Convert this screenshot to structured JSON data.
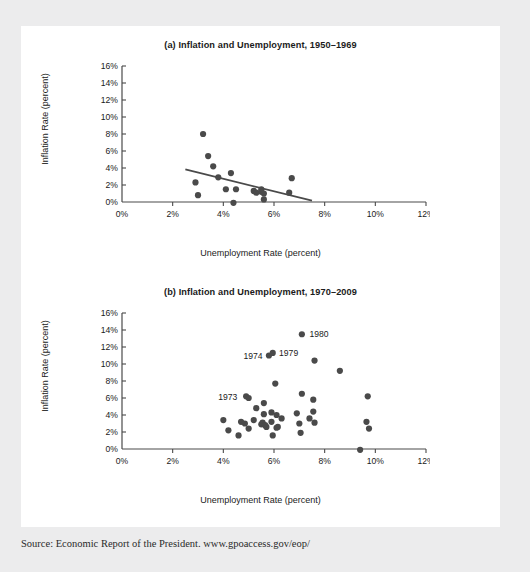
{
  "source_note": "Source: Economic Report of the President. www.gpoaccess.gov/eop/",
  "panel_a": {
    "title": "(a) Inflation and Unemployment, 1950–1969",
    "xlabel": "Unemployment Rate (percent)",
    "ylabel": "Inflation Rate (percent)"
  },
  "panel_b": {
    "title": "(b) Inflation and Unemployment, 1970–2009",
    "xlabel": "Unemployment Rate (percent)",
    "ylabel": "Inflation Rate (percent)"
  },
  "colors": {
    "page_background": "#ececed",
    "card_background": "#ffffff",
    "marker": "#4a4a4a",
    "axis": "#4a4a4a",
    "text": "#1b1b1b",
    "trendline": "#4a4a4a"
  },
  "chart_data": [
    {
      "type": "scatter",
      "id": "panel-a",
      "title": "(a) Inflation and Unemployment, 1950–1969",
      "xlabel": "Unemployment Rate (percent)",
      "ylabel": "Inflation Rate (percent)",
      "xlim": [
        0,
        12
      ],
      "ylim": [
        0,
        16
      ],
      "xticks": [
        0,
        2,
        4,
        6,
        8,
        10,
        12
      ],
      "xticklabels": [
        "0%",
        "2%",
        "4%",
        "6%",
        "8%",
        "10%",
        "12%"
      ],
      "yticks": [
        0,
        2,
        4,
        6,
        8,
        10,
        12,
        14,
        16
      ],
      "yticklabels": [
        "0%",
        "2%",
        "4%",
        "6%",
        "8%",
        "10%",
        "12%",
        "14%",
        "16%"
      ],
      "grid": false,
      "legend": "none",
      "points": [
        {
          "x": 2.9,
          "y": 2.3
        },
        {
          "x": 3.0,
          "y": 0.8
        },
        {
          "x": 3.2,
          "y": 8.0
        },
        {
          "x": 3.4,
          "y": 5.4
        },
        {
          "x": 3.6,
          "y": 4.2
        },
        {
          "x": 3.8,
          "y": 2.9
        },
        {
          "x": 4.1,
          "y": 1.5
        },
        {
          "x": 4.3,
          "y": 3.4
        },
        {
          "x": 4.4,
          "y": -0.1
        },
        {
          "x": 4.5,
          "y": 1.5
        },
        {
          "x": 5.2,
          "y": 1.3
        },
        {
          "x": 5.3,
          "y": 1.1
        },
        {
          "x": 5.5,
          "y": 1.5
        },
        {
          "x": 5.5,
          "y": 1.2
        },
        {
          "x": 5.6,
          "y": 1.0
        },
        {
          "x": 5.6,
          "y": 0.3
        },
        {
          "x": 6.7,
          "y": 2.8
        },
        {
          "x": 6.6,
          "y": 1.1
        }
      ],
      "trendline": {
        "x0": 2.5,
        "y0": 3.85,
        "x1": 7.5,
        "y1": 0.15
      },
      "annotations": []
    },
    {
      "type": "scatter",
      "id": "panel-b",
      "title": "(b) Inflation and Unemployment, 1970–2009",
      "xlabel": "Unemployment Rate (percent)",
      "ylabel": "Inflation Rate (percent)",
      "xlim": [
        0,
        12
      ],
      "ylim": [
        0,
        16
      ],
      "xticks": [
        0,
        2,
        4,
        6,
        8,
        10,
        12
      ],
      "xticklabels": [
        "0%",
        "2%",
        "4%",
        "6%",
        "8%",
        "10%",
        "12%"
      ],
      "yticks": [
        0,
        2,
        4,
        6,
        8,
        10,
        12,
        14,
        16
      ],
      "yticklabels": [
        "0%",
        "2%",
        "4%",
        "6%",
        "8%",
        "10%",
        "12%",
        "14%",
        "16%"
      ],
      "grid": false,
      "legend": "none",
      "points": [
        {
          "x": 4.0,
          "y": 3.4
        },
        {
          "x": 4.2,
          "y": 2.2
        },
        {
          "x": 4.6,
          "y": 1.6
        },
        {
          "x": 4.7,
          "y": 3.2
        },
        {
          "x": 4.85,
          "y": 3.0
        },
        {
          "x": 4.9,
          "y": 6.2
        },
        {
          "x": 5.0,
          "y": 6.0
        },
        {
          "x": 5.0,
          "y": 2.4
        },
        {
          "x": 5.2,
          "y": 3.4
        },
        {
          "x": 5.3,
          "y": 4.8
        },
        {
          "x": 5.5,
          "y": 2.9
        },
        {
          "x": 5.55,
          "y": 3.1
        },
        {
          "x": 5.6,
          "y": 5.4
        },
        {
          "x": 5.6,
          "y": 4.1
        },
        {
          "x": 5.65,
          "y": 2.8
        },
        {
          "x": 5.7,
          "y": 2.6
        },
        {
          "x": 5.8,
          "y": 11.0
        },
        {
          "x": 5.95,
          "y": 11.3
        },
        {
          "x": 5.9,
          "y": 4.3
        },
        {
          "x": 5.9,
          "y": 3.2
        },
        {
          "x": 5.95,
          "y": 1.6
        },
        {
          "x": 6.05,
          "y": 7.7
        },
        {
          "x": 6.1,
          "y": 4.0
        },
        {
          "x": 6.1,
          "y": 2.5
        },
        {
          "x": 6.15,
          "y": 2.6
        },
        {
          "x": 6.3,
          "y": 3.6
        },
        {
          "x": 6.9,
          "y": 4.2
        },
        {
          "x": 7.0,
          "y": 3.0
        },
        {
          "x": 7.1,
          "y": 6.5
        },
        {
          "x": 7.05,
          "y": 1.9
        },
        {
          "x": 7.1,
          "y": 13.5
        },
        {
          "x": 7.4,
          "y": 3.6
        },
        {
          "x": 7.6,
          "y": 10.4
        },
        {
          "x": 7.55,
          "y": 5.8
        },
        {
          "x": 7.55,
          "y": 4.4
        },
        {
          "x": 7.6,
          "y": 3.1
        },
        {
          "x": 8.6,
          "y": 9.2
        },
        {
          "x": 9.4,
          "y": -0.1
        },
        {
          "x": 9.7,
          "y": 6.2
        },
        {
          "x": 9.65,
          "y": 3.2
        },
        {
          "x": 9.75,
          "y": 2.4
        }
      ],
      "trendline": null,
      "annotations": [
        {
          "label": "1973",
          "x": 4.55,
          "y": 6.2,
          "anchor": "end"
        },
        {
          "label": "1974",
          "x": 5.55,
          "y": 11.0,
          "anchor": "end"
        },
        {
          "label": "1979",
          "x": 6.2,
          "y": 11.3,
          "anchor": "start"
        },
        {
          "label": "1980",
          "x": 7.4,
          "y": 13.5,
          "anchor": "start"
        }
      ]
    }
  ]
}
